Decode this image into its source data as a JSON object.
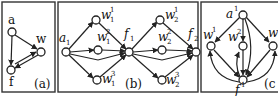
{
  "figure": {
    "panels": [
      {
        "id": "a",
        "caption": "(a)",
        "nodes": [
          {
            "id": "a",
            "label": "a",
            "sup": "",
            "sub": ""
          },
          {
            "id": "w",
            "label": "w",
            "sup": "",
            "sub": ""
          },
          {
            "id": "f",
            "label": "f",
            "sup": "",
            "sub": ""
          }
        ],
        "edges": [
          [
            "a",
            "w"
          ],
          [
            "a",
            "f"
          ],
          [
            "w",
            "f"
          ],
          [
            "f",
            "w"
          ]
        ]
      },
      {
        "id": "b",
        "caption": "(b)",
        "nodes": [
          {
            "id": "a1",
            "label": "a",
            "sup": "",
            "sub": "1"
          },
          {
            "id": "w11",
            "label": "w",
            "sup": "1",
            "sub": "1"
          },
          {
            "id": "w12",
            "label": "w",
            "sup": "2",
            "sub": "1"
          },
          {
            "id": "w13",
            "label": "w",
            "sup": "3",
            "sub": "1"
          },
          {
            "id": "f1",
            "label": "f",
            "sup": "",
            "sub": "1"
          },
          {
            "id": "w21",
            "label": "w",
            "sup": "1",
            "sub": "2"
          },
          {
            "id": "w22",
            "label": "w",
            "sup": "2",
            "sub": "2"
          },
          {
            "id": "w23",
            "label": "w",
            "sup": "3",
            "sub": "2"
          },
          {
            "id": "f2",
            "label": "f",
            "sup": "",
            "sub": "2"
          }
        ],
        "edges": [
          [
            "a1",
            "w11"
          ],
          [
            "a1",
            "w12"
          ],
          [
            "a1",
            "w13"
          ],
          [
            "a1",
            "f1"
          ],
          [
            "w11",
            "f1"
          ],
          [
            "w12",
            "f1"
          ],
          [
            "w13",
            "f1"
          ],
          [
            "f1",
            "w21"
          ],
          [
            "f1",
            "w22"
          ],
          [
            "f1",
            "w23"
          ],
          [
            "f1",
            "f2"
          ],
          [
            "w21",
            "f2"
          ],
          [
            "w22",
            "f2"
          ],
          [
            "w23",
            "f2"
          ]
        ]
      },
      {
        "id": "c",
        "caption": "(c",
        "nodes": [
          {
            "id": "a1",
            "label": "a",
            "sup": "1",
            "sub": ""
          },
          {
            "id": "w1",
            "label": "w",
            "sup": "1",
            "sub": ""
          },
          {
            "id": "w2",
            "label": "w",
            "sup": "2",
            "sub": ""
          },
          {
            "id": "w3",
            "label": "w",
            "sup": "",
            "sub": ""
          },
          {
            "id": "f1",
            "label": "f",
            "sup": "1",
            "sub": ""
          }
        ],
        "edges": [
          [
            "a1",
            "w1"
          ],
          [
            "a1",
            "w2"
          ],
          [
            "a1",
            "w3"
          ],
          [
            "a1",
            "f1"
          ],
          [
            "w1",
            "f1"
          ],
          [
            "w2",
            "f1"
          ],
          [
            "w3",
            "f1"
          ],
          [
            "f1",
            "w1"
          ],
          [
            "f1",
            "w2"
          ],
          [
            "f1",
            "w3"
          ]
        ]
      }
    ]
  }
}
